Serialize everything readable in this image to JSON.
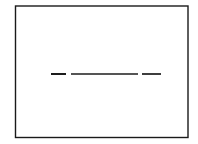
{
  "figure": {
    "title": "",
    "caption": "",
    "background_color": "#ffffff",
    "width": 198,
    "height": 144,
    "frame": {
      "name": "rectangle-border",
      "x": 15.5,
      "y": 6.0,
      "width": 172.5,
      "height": 131.5,
      "stroke_color": "#1a1a1a",
      "stroke_width": 1.4,
      "fill_color": "#ffffff"
    }
  },
  "chart_data": {
    "type": "line",
    "title": "",
    "subtitle": "",
    "xlabel": "",
    "ylabel": "",
    "grid": false,
    "legend": "none",
    "axis_visible": false,
    "tick_labels": [],
    "annotations": [],
    "xlim": [
      15.5,
      188.0
    ],
    "ylim": [
      6.0,
      137.5
    ],
    "series": [
      {
        "name": "broken-horizontal-line",
        "style": "dashed",
        "color": "#1c1c1c",
        "y": 74.0,
        "segments": [
          {
            "label": "segment-1",
            "x_start": 51.0,
            "x_end": 66.0,
            "stroke_width": 2.0
          },
          {
            "label": "segment-2",
            "x_start": 71.0,
            "x_end": 138.0,
            "stroke_width": 1.7
          },
          {
            "label": "segment-3",
            "x_start": 142.0,
            "x_end": 161.0,
            "stroke_width": 1.7
          }
        ],
        "gaps": [
          {
            "label": "gap-1",
            "x_start": 66.0,
            "x_end": 71.0
          },
          {
            "label": "gap-2",
            "x_start": 138.0,
            "x_end": 142.0
          }
        ]
      }
    ]
  }
}
